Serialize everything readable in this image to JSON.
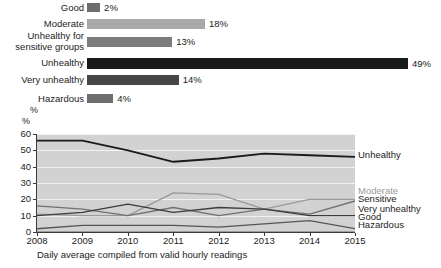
{
  "chart_data": [
    {
      "type": "bar",
      "orientation": "horizontal",
      "title": "",
      "xlabel": "%",
      "ylabel": "",
      "categories": [
        "Good",
        "Moderate",
        "Unhealthy for\nsensitive groups",
        "Unhealthy",
        "Very unhealthy",
        "Hazardous"
      ],
      "values": [
        2,
        18,
        13,
        49,
        14,
        4
      ],
      "value_labels": [
        "2%",
        "18%",
        "13%",
        "49%",
        "14%",
        "4%"
      ],
      "colors": [
        "#6e6e6e",
        "#a9a9a9",
        "#7d7d7d",
        "#1a1a1a",
        "#474747",
        "#6e6e6e"
      ],
      "xlim": [
        0,
        52
      ],
      "grid": false,
      "axis_unit": "%"
    },
    {
      "type": "line",
      "title": "",
      "xlabel": "",
      "ylabel": "%",
      "x": [
        "2008",
        "2009",
        "2010",
        "2011",
        "2012",
        "2013",
        "2014",
        "2015"
      ],
      "ylim": [
        0,
        60
      ],
      "yticks": [
        0,
        10,
        20,
        30,
        40,
        50,
        60
      ],
      "grid": true,
      "legend_position": "right",
      "caption": "Daily average compiled from valid hourly readings",
      "series": [
        {
          "name": "Unhealthy",
          "values": [
            56,
            56,
            50,
            43,
            45,
            48,
            47,
            46
          ],
          "color": "#1a1a1a",
          "width": 1.8
        },
        {
          "name": "Moderate",
          "values": [
            11,
            10,
            10,
            24,
            23,
            14,
            20,
            20
          ],
          "color": "#9a9a9a",
          "width": 1.3
        },
        {
          "name": "Sensitive",
          "values": [
            16,
            14,
            10,
            15,
            10,
            14,
            11,
            19
          ],
          "color": "#707070",
          "width": 1.3
        },
        {
          "name": "Very unhealthy",
          "values": [
            10,
            12,
            17,
            12,
            15,
            14,
            10,
            10
          ],
          "color": "#3c3c3c",
          "width": 1.3
        },
        {
          "name": "Good",
          "values": [
            2,
            4,
            4,
            4,
            3,
            5,
            7,
            2
          ],
          "color": "#565656",
          "width": 1.3
        },
        {
          "name": "Hazardous",
          "values": [
            0,
            0,
            0,
            0,
            0,
            0,
            0,
            0
          ],
          "color": "#8a8a8a",
          "width": 1.3
        }
      ]
    }
  ],
  "bar_chart": {
    "axis_unit": "%",
    "rows": [
      {
        "label": "Good",
        "value": "2%",
        "pct": 2,
        "color": "#6e6e6e",
        "two_line": false
      },
      {
        "label": "Moderate",
        "value": "18%",
        "pct": 18,
        "color": "#a9a9a9",
        "two_line": false
      },
      {
        "label": "Unhealthy for\nsensitive groups",
        "value": "13%",
        "pct": 13,
        "color": "#7d7d7d",
        "two_line": true
      },
      {
        "label": "Unhealthy",
        "value": "49%",
        "pct": 49,
        "color": "#1a1a1a",
        "two_line": false
      },
      {
        "label": "Very unhealthy",
        "value": "14%",
        "pct": 14,
        "color": "#474747",
        "two_line": false
      },
      {
        "label": "Hazardous",
        "value": "4%",
        "pct": 4,
        "color": "#6e6e6e",
        "two_line": false
      }
    ]
  },
  "line_chart": {
    "y_label": "%",
    "yticks": [
      "60",
      "50",
      "40",
      "30",
      "20",
      "10",
      "0"
    ],
    "xticks": [
      "2008",
      "2009",
      "2010",
      "2011",
      "2012",
      "2013",
      "2014",
      "2015"
    ],
    "legend": [
      {
        "name": "Unhealthy",
        "color": "#1a1a1a"
      },
      {
        "name": "Moderate",
        "color": "#9a9a9a"
      },
      {
        "name": "Sensitive",
        "color": "#1c1c1c"
      },
      {
        "name": "Very unhealthy",
        "color": "#1c1c1c"
      },
      {
        "name": "Good",
        "color": "#1c1c1c"
      },
      {
        "name": "Hazardous",
        "color": "#1c1c1c"
      }
    ],
    "caption": "Daily average compiled from valid hourly readings"
  }
}
